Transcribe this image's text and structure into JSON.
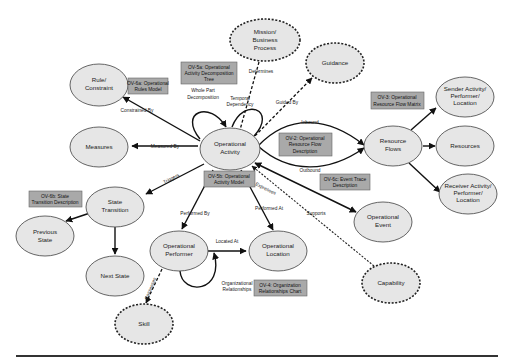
{
  "diagram": {
    "nodes": {
      "operational_activity": [
        "Operational",
        "Activity"
      ],
      "mission": [
        "Mission/",
        "Business",
        "Process"
      ],
      "guidance": [
        "Guidance"
      ],
      "rule": [
        "Rule/",
        "Constraint"
      ],
      "measures": [
        "Measures"
      ],
      "resource_flows": [
        "Resource",
        "Flows"
      ],
      "sender": [
        "Sender Activity/",
        "Performer/",
        "Location"
      ],
      "resources": [
        "Resources"
      ],
      "receiver": [
        "Receiver Activity/",
        "Performer/",
        "Location"
      ],
      "state_transition": [
        "State",
        "Transition"
      ],
      "previous_state": [
        "Previous",
        "State"
      ],
      "next_state": [
        "Next State"
      ],
      "operational_performer": [
        "Operational",
        "Performer"
      ],
      "operational_location": [
        "Operational",
        "Location"
      ],
      "operational_event": [
        "Operational",
        "Event"
      ],
      "capability": [
        "Capability"
      ],
      "skill": [
        "Skill"
      ]
    },
    "edges": {
      "determines": "Determines",
      "temporal_dependency": [
        "Temporal",
        "Dependency"
      ],
      "guided_by": "Guided By",
      "whole_part": [
        "Whole Part",
        "Decomposition"
      ],
      "constrained_by": "Constrained By",
      "measured_by": "Measured By",
      "inbound": "Inbound",
      "outbound": "Outbound",
      "triggers": "Triggers",
      "performed_by": "Performed By",
      "performed_at": "Performed At",
      "located_at": "Located At",
      "org_relationships": [
        "Organizational",
        "Relationships"
      ],
      "expresses": "Expresses",
      "supports": "Supports",
      "possesses": "Possesses"
    },
    "views": {
      "ov5a": [
        "OV-5a: Operational",
        "Activity Decomposition",
        "Tree"
      ],
      "ov6a": [
        "OV-6a: Operational",
        "Rules Model"
      ],
      "ov3": [
        "OV-3: Operational",
        "Resource Flow Matrix"
      ],
      "ov2": [
        "OV-2: Operational",
        "Resource Flow",
        "Description"
      ],
      "ov6c": [
        "OV-6c: Event Trace",
        "Description"
      ],
      "ov5b": [
        "OV-5b: Operational",
        "Activity Model"
      ],
      "ov6b": [
        "OV-6b: State",
        "Transition Description"
      ],
      "ov4": [
        "OV-4: Organization",
        "Relationships Chart"
      ]
    },
    "colors": {
      "node_fill": "#e6e6e6",
      "view_box_fill": "#a9a9a9",
      "edge": "#111111"
    }
  }
}
